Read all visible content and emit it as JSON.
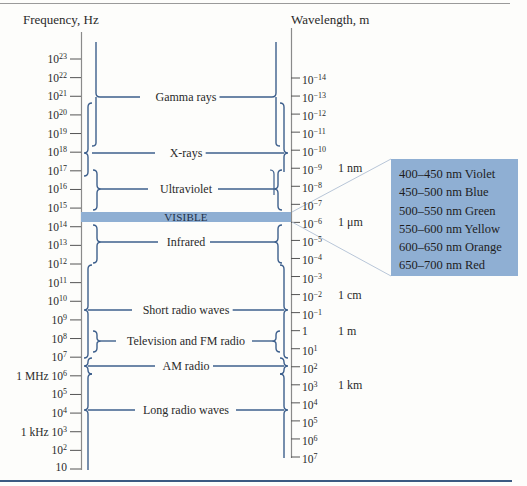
{
  "title_left": "Frequency, Hz",
  "title_right": "Wavelength, m",
  "frequency_ticks": [
    {
      "base": "10",
      "exp": "23",
      "prefix": ""
    },
    {
      "base": "10",
      "exp": "22",
      "prefix": ""
    },
    {
      "base": "10",
      "exp": "21",
      "prefix": ""
    },
    {
      "base": "10",
      "exp": "20",
      "prefix": ""
    },
    {
      "base": "10",
      "exp": "19",
      "prefix": ""
    },
    {
      "base": "10",
      "exp": "18",
      "prefix": ""
    },
    {
      "base": "10",
      "exp": "17",
      "prefix": ""
    },
    {
      "base": "10",
      "exp": "16",
      "prefix": ""
    },
    {
      "base": "10",
      "exp": "15",
      "prefix": ""
    },
    {
      "base": "10",
      "exp": "14",
      "prefix": ""
    },
    {
      "base": "10",
      "exp": "13",
      "prefix": ""
    },
    {
      "base": "10",
      "exp": "12",
      "prefix": ""
    },
    {
      "base": "10",
      "exp": "11",
      "prefix": ""
    },
    {
      "base": "10",
      "exp": "10",
      "prefix": ""
    },
    {
      "base": "10",
      "exp": "9",
      "prefix": ""
    },
    {
      "base": "10",
      "exp": "8",
      "prefix": ""
    },
    {
      "base": "10",
      "exp": "7",
      "prefix": ""
    },
    {
      "base": "10",
      "exp": "6",
      "prefix": "1 MHz "
    },
    {
      "base": "10",
      "exp": "5",
      "prefix": ""
    },
    {
      "base": "10",
      "exp": "4",
      "prefix": ""
    },
    {
      "base": "10",
      "exp": "3",
      "prefix": "1 kHz "
    },
    {
      "base": "10",
      "exp": "2",
      "prefix": ""
    },
    {
      "base": "10",
      "exp": "",
      "prefix": ""
    }
  ],
  "wavelength_ticks": [
    {
      "base": "10",
      "exp": "−14",
      "unit": ""
    },
    {
      "base": "10",
      "exp": "−13",
      "unit": ""
    },
    {
      "base": "10",
      "exp": "−12",
      "unit": ""
    },
    {
      "base": "10",
      "exp": "−11",
      "unit": ""
    },
    {
      "base": "10",
      "exp": "−10",
      "unit": ""
    },
    {
      "base": "10",
      "exp": "−9",
      "unit": "1 nm"
    },
    {
      "base": "10",
      "exp": "−8",
      "unit": ""
    },
    {
      "base": "10",
      "exp": "−7",
      "unit": ""
    },
    {
      "base": "10",
      "exp": "−6",
      "unit": "1 μm"
    },
    {
      "base": "10",
      "exp": "−5",
      "unit": ""
    },
    {
      "base": "10",
      "exp": "−4",
      "unit": ""
    },
    {
      "base": "10",
      "exp": "−3",
      "unit": ""
    },
    {
      "base": "10",
      "exp": "−2",
      "unit": "1 cm"
    },
    {
      "base": "10",
      "exp": "−1",
      "unit": ""
    },
    {
      "base": "1",
      "exp": "",
      "unit": "1 m"
    },
    {
      "base": "10",
      "exp": "1",
      "unit": ""
    },
    {
      "base": "10",
      "exp": "2",
      "unit": ""
    },
    {
      "base": "10",
      "exp": "3",
      "unit": "1 km"
    },
    {
      "base": "10",
      "exp": "4",
      "unit": ""
    },
    {
      "base": "10",
      "exp": "5",
      "unit": ""
    },
    {
      "base": "10",
      "exp": "6",
      "unit": ""
    },
    {
      "base": "10",
      "exp": "7",
      "unit": ""
    }
  ],
  "bands": [
    {
      "label": "Gamma rays",
      "y": 97
    },
    {
      "label": "X-rays",
      "y": 153
    },
    {
      "label": "Ultraviolet",
      "y": 189
    },
    {
      "label": "Infrared",
      "y": 242
    },
    {
      "label": "Short radio waves",
      "y": 310
    },
    {
      "label": "Television and FM radio",
      "y": 341
    },
    {
      "label": "AM radio",
      "y": 366
    },
    {
      "label": "Long radio waves",
      "y": 410
    }
  ],
  "visible_band": {
    "label": "VISIBLE",
    "color": "#8fafd3"
  },
  "visible_colors": [
    "400–450 nm Violet",
    "450–500 nm Blue",
    "500–550 nm Green",
    "550–600 nm Yellow",
    "600–650 nm Orange",
    "650–700 nm Red"
  ],
  "colors": {
    "bracket": "#3d5f8c",
    "axis": "#8a8a8a",
    "band": "#8fafd3",
    "frame": "#3c5a82"
  }
}
